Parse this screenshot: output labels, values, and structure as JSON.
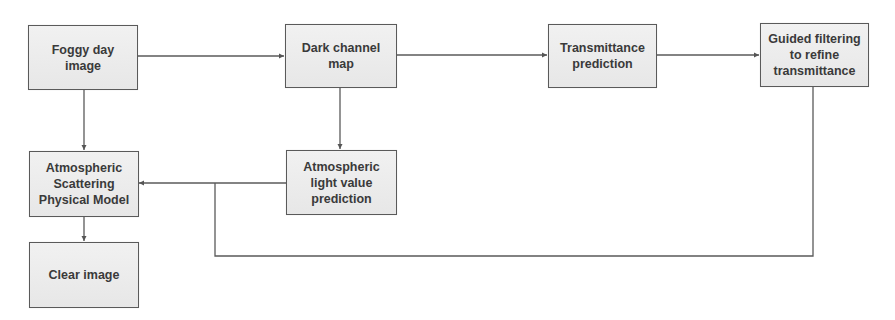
{
  "diagram": {
    "title": "",
    "nodes": [
      {
        "id": "foggy",
        "label": "Foggy day image"
      },
      {
        "id": "dark",
        "label": "Dark channel map"
      },
      {
        "id": "trans",
        "label": "Transmittance prediction"
      },
      {
        "id": "guided",
        "label": "Guided filtering to refine transmittance"
      },
      {
        "id": "scatter",
        "label": "Atmospheric Scattering Physical Model"
      },
      {
        "id": "atmlight",
        "label": "Atmospheric light value prediction"
      },
      {
        "id": "clear",
        "label": "Clear image"
      }
    ],
    "edges": [
      {
        "from": "foggy",
        "to": "dark"
      },
      {
        "from": "dark",
        "to": "trans"
      },
      {
        "from": "trans",
        "to": "guided"
      },
      {
        "from": "foggy",
        "to": "scatter"
      },
      {
        "from": "dark",
        "to": "atmlight"
      },
      {
        "from": "atmlight",
        "to": "scatter"
      },
      {
        "from": "guided",
        "to": "scatter"
      },
      {
        "from": "scatter",
        "to": "clear"
      }
    ],
    "colors": {
      "box_fill": "#ececec",
      "box_border": "#5a5a5a",
      "line": "#555555",
      "text": "#3a3a3a"
    }
  }
}
